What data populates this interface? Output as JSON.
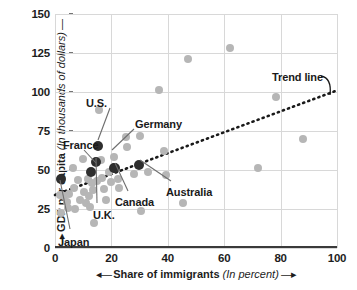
{
  "chart_data": {
    "type": "scatter",
    "title": "",
    "xlabel": "Share of immigrants (In percent)",
    "ylabel": "GDP per capita (In thousands of dollars)",
    "xlabel_bold": "Share of immigrants",
    "xlabel_italic": "(In percent)",
    "ylabel_bold": "GDP per capita",
    "ylabel_italic": "(In thousands of dollars)",
    "xlim": [
      0,
      100
    ],
    "ylim": [
      0,
      150
    ],
    "xticks": [
      0,
      20,
      40,
      60,
      80,
      100
    ],
    "yticks": [
      0,
      25,
      50,
      75,
      100,
      125,
      150
    ],
    "xtick_labels": [
      "0",
      "20",
      "40",
      "60",
      "80",
      "100"
    ],
    "ytick_labels": [
      "0",
      "25",
      "50",
      "75",
      "100",
      "125",
      "150"
    ],
    "grid": true,
    "legend": "none",
    "axis_arrows": true,
    "point_color_highlight": "#2e2e2e",
    "point_color_other": "#b6b6b6",
    "trendline": {
      "label": "Trend line",
      "style": "dotted",
      "color": "#1a1a1a",
      "x0": 0,
      "y0": 34,
      "x1": 100,
      "y1": 101
    },
    "highlighted_points": [
      {
        "name": "Japan",
        "x": 2.0,
        "y": 44.0
      },
      {
        "name": "France",
        "x": 12.8,
        "y": 49.0
      },
      {
        "name": "U.K.",
        "x": 14.5,
        "y": 55.0
      },
      {
        "name": "U.S.",
        "x": 15.3,
        "y": 65.5
      },
      {
        "name": "Germany",
        "x": 20.8,
        "y": 51.5
      },
      {
        "name": "Canada",
        "x": 21.3,
        "y": 51.0
      },
      {
        "name": "Australia",
        "x": 29.8,
        "y": 53.0
      }
    ],
    "other_points": [
      {
        "x": 1.8,
        "y": 34.0
      },
      {
        "x": 2.2,
        "y": 22.5
      },
      {
        "x": 3.3,
        "y": 33.5
      },
      {
        "x": 4.2,
        "y": 29.5
      },
      {
        "x": 4.6,
        "y": 25.5
      },
      {
        "x": 5.0,
        "y": 34.5
      },
      {
        "x": 6.5,
        "y": 51.0
      },
      {
        "x": 6.8,
        "y": 38.5
      },
      {
        "x": 7.0,
        "y": 25.0
      },
      {
        "x": 8.2,
        "y": 43.5
      },
      {
        "x": 9.0,
        "y": 31.0
      },
      {
        "x": 10.0,
        "y": 57.0
      },
      {
        "x": 10.4,
        "y": 36.0
      },
      {
        "x": 11.0,
        "y": 29.0
      },
      {
        "x": 11.6,
        "y": 44.5
      },
      {
        "x": 12.0,
        "y": 33.5
      },
      {
        "x": 12.4,
        "y": 26.0
      },
      {
        "x": 13.0,
        "y": 41.5
      },
      {
        "x": 13.4,
        "y": 37.0
      },
      {
        "x": 13.8,
        "y": 16.0
      },
      {
        "x": 14.8,
        "y": 43.0
      },
      {
        "x": 15.6,
        "y": 88.5
      },
      {
        "x": 16.2,
        "y": 56.5
      },
      {
        "x": 16.8,
        "y": 45.0
      },
      {
        "x": 17.4,
        "y": 38.0
      },
      {
        "x": 18.0,
        "y": 30.5
      },
      {
        "x": 19.2,
        "y": 48.5
      },
      {
        "x": 20.0,
        "y": 42.0
      },
      {
        "x": 21.0,
        "y": 58.5
      },
      {
        "x": 22.2,
        "y": 44.0
      },
      {
        "x": 22.6,
        "y": 38.5
      },
      {
        "x": 25.2,
        "y": 71.0
      },
      {
        "x": 25.5,
        "y": 64.5
      },
      {
        "x": 28.0,
        "y": 47.5
      },
      {
        "x": 30.0,
        "y": 71.5
      },
      {
        "x": 30.5,
        "y": 23.5
      },
      {
        "x": 33.0,
        "y": 49.0
      },
      {
        "x": 37.0,
        "y": 101.5
      },
      {
        "x": 38.5,
        "y": 62.5
      },
      {
        "x": 39.5,
        "y": 47.0
      },
      {
        "x": 45.5,
        "y": 29.0
      },
      {
        "x": 47.0,
        "y": 121.0
      },
      {
        "x": 62.0,
        "y": 128.5
      },
      {
        "x": 72.0,
        "y": 51.5
      },
      {
        "x": 78.5,
        "y": 97.0
      },
      {
        "x": 88.0,
        "y": 70.0
      }
    ],
    "annotations": [
      {
        "label": "U.S.",
        "lx": 86,
        "ly": 97,
        "ax": 110,
        "ay": 108,
        "px": 98,
        "py": 140
      },
      {
        "label": "Germany",
        "lx": 135,
        "ly": 118,
        "ax": 134,
        "ay": 129,
        "px": 112,
        "py": 150
      },
      {
        "label": "France",
        "lx": 63,
        "ly": 139,
        "ax": 84,
        "ay": 150,
        "px": 96,
        "py": 163
      },
      {
        "label": "Canada",
        "lx": 115,
        "ly": 196,
        "ax": 128,
        "ay": 191,
        "px": 115,
        "py": 163
      },
      {
        "label": "Australia",
        "lx": 166,
        "ly": 186,
        "ax": 171,
        "ay": 181,
        "px": 140,
        "py": 160
      },
      {
        "label": "U.K.",
        "lx": 93,
        "ly": 209,
        "ax": 97,
        "ay": 203,
        "px": 96,
        "py": 158
      },
      {
        "label": "Japan",
        "lx": 58,
        "ly": 236,
        "ax": 70,
        "ay": 229,
        "px": 60,
        "py": 180
      },
      {
        "label": "Trend line",
        "lx": 272,
        "ly": 71,
        "ax": 0,
        "ay": 0,
        "px": 0,
        "py": 0
      }
    ]
  }
}
